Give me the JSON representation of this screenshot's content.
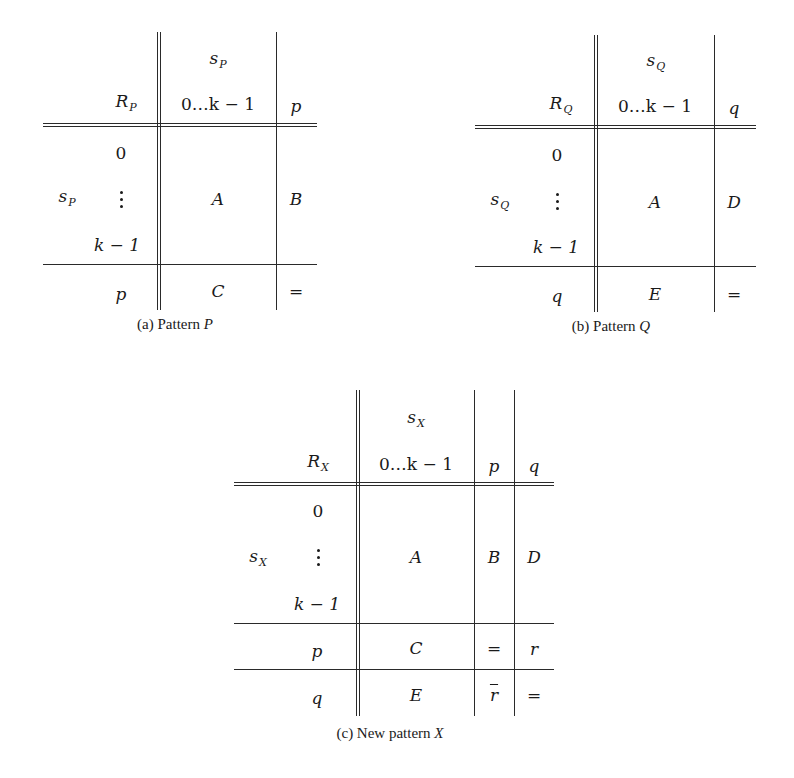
{
  "figures": [
    {
      "id": "a",
      "caption": {
        "prefix": "(a) Pattern ",
        "var": "P"
      },
      "corner": {
        "sym": "R",
        "sub": "P"
      },
      "col_group": {
        "sym": "s",
        "sub": "P"
      },
      "col_range": "0…k − 1",
      "extra_cols": [
        "p"
      ],
      "row_group": {
        "sym": "s",
        "sub": "P"
      },
      "row_labels": {
        "first": "0",
        "last": "k − 1"
      },
      "extra_rows": [
        "p"
      ],
      "cells": {
        "main": "A",
        "right": [
          "B"
        ],
        "bottom": [
          {
            "mid": "C",
            "right": [
              "="
            ]
          }
        ]
      }
    },
    {
      "id": "b",
      "caption": {
        "prefix": "(b) Pattern ",
        "var": "Q"
      },
      "corner": {
        "sym": "R",
        "sub": "Q"
      },
      "col_group": {
        "sym": "s",
        "sub": "Q"
      },
      "col_range": "0…k − 1",
      "extra_cols": [
        "q"
      ],
      "row_group": {
        "sym": "s",
        "sub": "Q"
      },
      "row_labels": {
        "first": "0",
        "last": "k − 1"
      },
      "extra_rows": [
        "q"
      ],
      "cells": {
        "main": "A",
        "right": [
          "D"
        ],
        "bottom": [
          {
            "mid": "E",
            "right": [
              "="
            ]
          }
        ]
      }
    },
    {
      "id": "c",
      "caption": {
        "prefix": "(c) New pattern ",
        "var": "X"
      },
      "corner": {
        "sym": "R",
        "sub": "X"
      },
      "col_group": {
        "sym": "s",
        "sub": "X"
      },
      "col_range": "0…k − 1",
      "extra_cols": [
        "p",
        "q"
      ],
      "row_group": {
        "sym": "s",
        "sub": "X"
      },
      "row_labels": {
        "first": "0",
        "last": "k − 1"
      },
      "extra_rows": [
        "p",
        "q"
      ],
      "cells": {
        "main": "A",
        "right": [
          "B",
          "D"
        ],
        "bottom": [
          {
            "mid": "C",
            "right": [
              "=",
              "r"
            ]
          },
          {
            "mid": "E",
            "right": [
              "r",
              "="
            ]
          }
        ]
      }
    }
  ]
}
